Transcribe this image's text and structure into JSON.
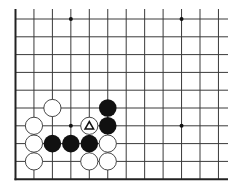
{
  "diagram": {
    "type": "go-board-fragment",
    "colors": {
      "background": "#ffffff",
      "grid": "#3a3a3a",
      "edge": "#222222",
      "black_stone": "#111111",
      "white_stone_fill": "#ffffff",
      "white_stone_stroke": "#333333",
      "hoshi": "#111111"
    },
    "grid": {
      "origin_x": 15.5,
      "origin_y": 19,
      "spacing_x": 18.45,
      "spacing_y": 17.8,
      "columns": 12,
      "rows": 10,
      "right_extent_x": 228,
      "top_extent_y": 9,
      "left_edge": true,
      "bottom_edge": true
    },
    "hoshi": [
      {
        "col": 3,
        "row": 0
      },
      {
        "col": 9,
        "row": 0
      },
      {
        "col": 3,
        "row": 6
      },
      {
        "col": 9,
        "row": 6
      }
    ],
    "stones": [
      {
        "color": "white",
        "col": 2,
        "row": 5
      },
      {
        "color": "white",
        "col": 1,
        "row": 6
      },
      {
        "color": "white",
        "col": 1,
        "row": 7
      },
      {
        "color": "white",
        "col": 1,
        "row": 8
      },
      {
        "color": "black",
        "col": 2,
        "row": 7
      },
      {
        "color": "black",
        "col": 3,
        "row": 7
      },
      {
        "color": "black",
        "col": 4,
        "row": 7
      },
      {
        "color": "white",
        "col": 4,
        "row": 6,
        "marker": "triangle"
      },
      {
        "color": "black",
        "col": 5,
        "row": 5
      },
      {
        "color": "black",
        "col": 5,
        "row": 6
      },
      {
        "color": "white",
        "col": 5,
        "row": 7
      },
      {
        "color": "white",
        "col": 4,
        "row": 8
      },
      {
        "color": "white",
        "col": 5,
        "row": 8
      }
    ],
    "markers": [
      {
        "symbol": "△",
        "col": 4,
        "row": 6,
        "on": "white-stone"
      }
    ]
  }
}
